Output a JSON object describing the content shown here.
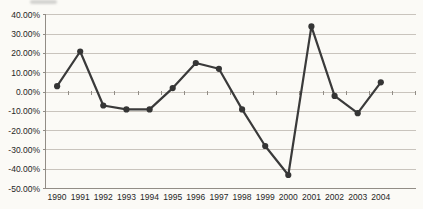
{
  "chart_data": {
    "type": "line",
    "title": "",
    "xlabel": "",
    "ylabel": "",
    "categories": [
      "1990",
      "1991",
      "1992",
      "1993",
      "1994",
      "1995",
      "1996",
      "1997",
      "1998",
      "1999",
      "2000",
      "2001",
      "2002",
      "2003",
      "2004"
    ],
    "series": [
      {
        "name": "annual-percent-change",
        "values": [
          3,
          21,
          -7,
          -9,
          -9,
          2,
          15,
          12,
          -9,
          -28,
          -43,
          34,
          -2,
          -11,
          5
        ]
      }
    ],
    "ylim": [
      -50,
      40
    ],
    "y_ticks": [
      {
        "value": 40,
        "label": "40.00%"
      },
      {
        "value": 30,
        "label": "30.00%"
      },
      {
        "value": 20,
        "label": "20.00%"
      },
      {
        "value": 10,
        "label": "10.00%"
      },
      {
        "value": 0,
        "label": "0.00%"
      },
      {
        "value": -10,
        "label": "-10.00%"
      },
      {
        "value": -20,
        "label": "-20.00%"
      },
      {
        "value": -30,
        "label": "-30.00%"
      },
      {
        "value": -40,
        "label": "-40.00%"
      },
      {
        "value": -50,
        "label": "-50.00%"
      }
    ],
    "grid": true,
    "legend": false,
    "marker": "circle",
    "colors": {
      "line": "#3a3a3a",
      "marker": "#353535",
      "grid": "#c9c4bd",
      "axis": "#928d86",
      "text": "#262626",
      "background": "#fbfaf6"
    }
  }
}
